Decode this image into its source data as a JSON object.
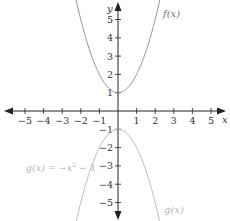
{
  "chart_data": {
    "type": "line",
    "title": "",
    "xlabel": "x",
    "ylabel": "y",
    "xlim": [
      -5.5,
      5.5
    ],
    "ylim": [
      -5.8,
      5.8
    ],
    "grid": false,
    "x_ticks": [
      -5,
      -4,
      -3,
      -2,
      -1,
      1,
      2,
      3,
      4,
      5
    ],
    "x_tick_labels": [
      "−5",
      "−4",
      "−3",
      "−2",
      "−1",
      "1",
      "2",
      "3",
      "4",
      "5"
    ],
    "y_ticks": [
      5,
      4,
      3,
      2,
      1,
      -1,
      -2,
      -3,
      -4,
      -5
    ],
    "y_tick_labels": [
      "5",
      "4",
      "3",
      "2",
      "1",
      "−1",
      "−2",
      "−3",
      "−4",
      "−5"
    ],
    "series": [
      {
        "name": "f(x)",
        "label": "f(x)",
        "expression": "x^2 + 1",
        "color": "#8a8a8a",
        "x": [
          -2.4,
          -2,
          -1.5,
          -1,
          -0.5,
          0,
          0.5,
          1,
          1.5,
          2,
          2.4
        ],
        "values": [
          6.76,
          5,
          3.25,
          2,
          1.25,
          1,
          1.25,
          2,
          3.25,
          5,
          6.76
        ]
      },
      {
        "name": "g(x)",
        "label": "g(x)",
        "expression": "-x^2 - 1",
        "color": "#b4b4b4",
        "x": [
          -2.4,
          -2,
          -1.5,
          -1,
          -0.5,
          0,
          0.5,
          1,
          1.5,
          2,
          2.4
        ],
        "values": [
          -6.76,
          -5,
          -3.25,
          -2,
          -1.25,
          -1,
          -1.25,
          -2,
          -3.25,
          -5,
          -6.76
        ]
      }
    ],
    "annotations": [
      {
        "text": "g(x) = −x² − 1",
        "color": "#b4b4b4",
        "position": "left of g curve near y=-3"
      }
    ]
  },
  "labels": {
    "x_axis": "x",
    "y_axis": "y",
    "f_label": "f(x)",
    "g_label": "g(x)",
    "g_equation_prefix": "g(x) = −x",
    "g_equation_exp": "2",
    "g_equation_suffix": " − 1"
  }
}
